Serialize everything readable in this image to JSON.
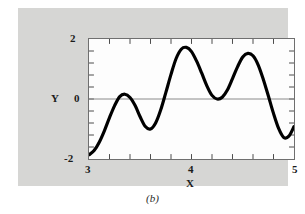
{
  "figure": {
    "caption": "(b)",
    "panel_color": "#d6d6d4",
    "plot_background": "#fdfdfd",
    "curve_color": "#000000",
    "zero_line_color": "#888888",
    "frame_color": "#6f6f6f"
  },
  "chart_data": {
    "type": "line",
    "title": "",
    "xlabel": "X",
    "ylabel": "Y",
    "xlim": [
      3,
      5
    ],
    "ylim": [
      -2,
      2
    ],
    "xticks": [
      3,
      4,
      5
    ],
    "xtick_labels": [
      "3",
      "4",
      "5"
    ],
    "yticks": [
      -2,
      0,
      2
    ],
    "ytick_labels": [
      "-2",
      "0",
      "2"
    ],
    "x_minor_tick_step": 0.2,
    "y_minor_tick_step": 0.4,
    "grid": false,
    "zero_line": true,
    "legend": null,
    "series": [
      {
        "name": "curve",
        "x": [
          3.0,
          3.05,
          3.1,
          3.15,
          3.2,
          3.25,
          3.3,
          3.35,
          3.4,
          3.45,
          3.5,
          3.55,
          3.6,
          3.65,
          3.7,
          3.75,
          3.8,
          3.85,
          3.9,
          3.95,
          4.0,
          4.05,
          4.1,
          4.15,
          4.2,
          4.25,
          4.3,
          4.35,
          4.4,
          4.45,
          4.5,
          4.55,
          4.6,
          4.65,
          4.7,
          4.75,
          4.8,
          4.85,
          4.9,
          4.95,
          5.0
        ],
        "y": [
          -1.86,
          -1.72,
          -1.44,
          -1.06,
          -0.62,
          -0.22,
          0.08,
          0.16,
          0.05,
          -0.22,
          -0.6,
          -0.92,
          -1.0,
          -0.8,
          -0.36,
          0.22,
          0.82,
          1.35,
          1.66,
          1.72,
          1.58,
          1.26,
          0.86,
          0.44,
          0.12,
          0.0,
          0.06,
          0.3,
          0.68,
          1.08,
          1.4,
          1.52,
          1.44,
          1.14,
          0.66,
          0.1,
          -0.48,
          -0.98,
          -1.28,
          -1.24,
          -0.92
        ]
      }
    ]
  }
}
